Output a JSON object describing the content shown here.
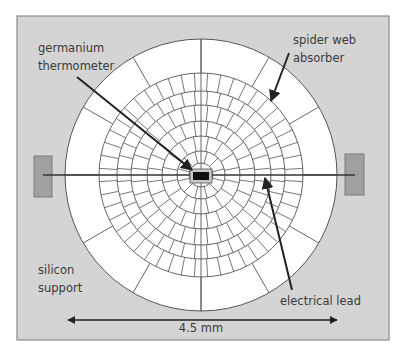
{
  "canvas": {
    "width": 403,
    "height": 355,
    "background": "#ffffff"
  },
  "frame": {
    "x": 17,
    "y": 16,
    "width": 372,
    "height": 324,
    "fill": "#d4d4d4",
    "stroke": "#8a8a8a"
  },
  "colors": {
    "absorber_fill": "#ffffff",
    "grid_stroke": "#555555",
    "lead_stroke": "#333333",
    "pad_fill": "#a0a0a0",
    "pad_stroke": "#7a7a7a",
    "thermometer_fill": "#111111",
    "thermometer_mount_fill": "#c8c8c8",
    "arrow_stroke": "#222222",
    "label_color": "#3a3a3a"
  },
  "absorber": {
    "center": [
      201,
      175
    ],
    "outer_radius": 136,
    "web_outer_radius": 102,
    "outer_spokes": 12,
    "rings": [
      {
        "r_in": 12,
        "r_out": 24,
        "spokes": 12
      },
      {
        "r_in": 24,
        "r_out": 39,
        "spokes": 16
      },
      {
        "r_in": 39,
        "r_out": 54,
        "spokes": 24
      },
      {
        "r_in": 54,
        "r_out": 70,
        "spokes": 32
      },
      {
        "r_in": 70,
        "r_out": 84,
        "spokes": 40
      },
      {
        "r_in": 84,
        "r_out": 102,
        "spokes": 48
      }
    ]
  },
  "thermometer": {
    "mount": {
      "x": 190,
      "y": 169,
      "width": 22,
      "height": 14
    },
    "chip": {
      "x": 193,
      "y": 172,
      "width": 16,
      "height": 8
    },
    "inner_square_radius": 12
  },
  "pads": [
    {
      "name": "left",
      "x": 34,
      "y": 156,
      "width": 18,
      "height": 41
    },
    {
      "name": "right",
      "x": 345,
      "y": 154,
      "width": 19,
      "height": 41
    }
  ],
  "lead": {
    "x1": 43,
    "y1": 175,
    "x2": 355,
    "y2": 175
  },
  "labels": {
    "germanium": {
      "line1": "germanium",
      "line2": "thermometer",
      "x": 38,
      "y1": 52,
      "y2": 70
    },
    "spider_web": {
      "line1": "spider web",
      "line2": "absorber",
      "x": 293,
      "y1": 44,
      "y2": 62
    },
    "silicon": {
      "line1": "silicon",
      "line2": "support",
      "x": 38,
      "y1": 274,
      "y2": 292
    },
    "electrical_lead": {
      "text": "electrical lead",
      "x": 280,
      "y": 305
    },
    "scale": {
      "text": "4.5 mm",
      "x": 201,
      "y": 332
    }
  },
  "arrows": [
    {
      "name": "germanium-arrow",
      "x1": 77,
      "y1": 77,
      "x2": 192,
      "y2": 170
    },
    {
      "name": "spider-web-arrow",
      "x1": 289,
      "y1": 53,
      "x2": 271,
      "y2": 101
    },
    {
      "name": "electrical-lead-arrow",
      "x1": 292,
      "y1": 290,
      "x2": 265,
      "y2": 178
    }
  ],
  "scale_bar": {
    "x1": 68,
    "x2": 337,
    "y": 320,
    "label": "4.5 mm"
  }
}
